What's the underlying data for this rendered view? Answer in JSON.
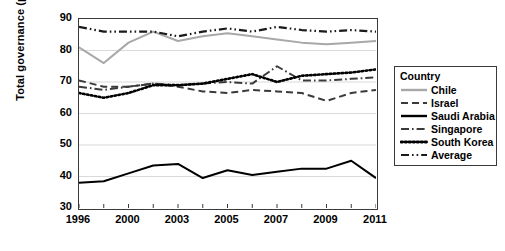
{
  "chart_data": {
    "type": "line",
    "title": "",
    "xlabel": "",
    "ylabel": "Total governance (percentile)",
    "ylim": [
      30,
      90
    ],
    "ytick_step": 10,
    "yticks": [
      30,
      40,
      50,
      60,
      70,
      80,
      90
    ],
    "grid": true,
    "grid_axis": "y",
    "legend_position": "right",
    "legend_title": "Country",
    "x": [
      1996,
      1998,
      2000,
      2002,
      2003,
      2004,
      2005,
      2006,
      2007,
      2008,
      2009,
      2010,
      2011
    ],
    "xtick_labels": [
      "1996",
      "",
      "2000",
      "",
      "2003",
      "",
      "2005",
      "",
      "2007",
      "",
      "2009",
      "",
      "2011"
    ],
    "xticks_shown": [
      "1996",
      "2000",
      "2003",
      "2005",
      "2007",
      "2009",
      "2011"
    ],
    "series": [
      {
        "name": "Chile",
        "style": "solid",
        "color": "#a8a8a8",
        "values": [
          81.0,
          76.0,
          82.5,
          86.0,
          83.0,
          84.5,
          85.5,
          84.5,
          83.5,
          82.5,
          82.0,
          82.5,
          83.0
        ]
      },
      {
        "name": "Israel",
        "style": "dashed",
        "color": "#3a3a3a",
        "values": [
          70.5,
          68.5,
          68.5,
          69.5,
          68.5,
          67.0,
          66.5,
          67.5,
          67.0,
          66.5,
          64.0,
          66.5,
          67.5
        ]
      },
      {
        "name": "Saudi Arabia",
        "style": "solid",
        "color": "#000000",
        "values": [
          38.0,
          38.5,
          41.0,
          43.5,
          44.0,
          39.5,
          42.0,
          40.5,
          41.5,
          42.5,
          42.5,
          45.0,
          39.5
        ]
      },
      {
        "name": "Singapore",
        "style": "dashdot",
        "color": "#3a3a3a",
        "values": [
          68.5,
          67.5,
          68.5,
          69.5,
          69.0,
          69.5,
          70.0,
          69.5,
          75.0,
          70.5,
          70.5,
          71.0,
          71.5
        ]
      },
      {
        "name": "South Korea",
        "style": "dotted",
        "color": "#000000",
        "values": [
          66.5,
          65.0,
          66.5,
          69.0,
          69.0,
          69.5,
          71.0,
          72.5,
          70.0,
          72.0,
          72.5,
          73.0,
          74.0
        ]
      },
      {
        "name": "Average",
        "style": "dashdotdot",
        "color": "#1a1a1a",
        "values": [
          87.5,
          86.0,
          86.0,
          86.0,
          84.5,
          86.0,
          87.0,
          86.0,
          87.5,
          86.5,
          86.0,
          86.5,
          86.0
        ]
      }
    ]
  },
  "legend": {
    "title": "Country",
    "items": [
      {
        "label": "Chile",
        "key": "solid-gray"
      },
      {
        "label": "Israel",
        "key": "dashed"
      },
      {
        "label": "Saudi Arabia",
        "key": "solid-black"
      },
      {
        "label": "Singapore",
        "key": "dashdot"
      },
      {
        "label": "South Korea",
        "key": "dotted"
      },
      {
        "label": "Average",
        "key": "dashdotdot"
      }
    ]
  },
  "axes": {
    "y_title": "Total governance (percentile)",
    "y_labels": [
      "90",
      "80",
      "70",
      "60",
      "50",
      "40",
      "30"
    ],
    "x_labels": [
      "1996",
      "2000",
      "2003",
      "2005",
      "2007",
      "2009",
      "2011"
    ]
  },
  "colors": {
    "chile": "#a8a8a8",
    "israel": "#3a3a3a",
    "saudi_arabia": "#000000",
    "singapore": "#3a3a3a",
    "south_korea": "#000000",
    "average": "#1a1a1a",
    "frame": "#3a3a3a",
    "grid": "#d9d9d9"
  }
}
